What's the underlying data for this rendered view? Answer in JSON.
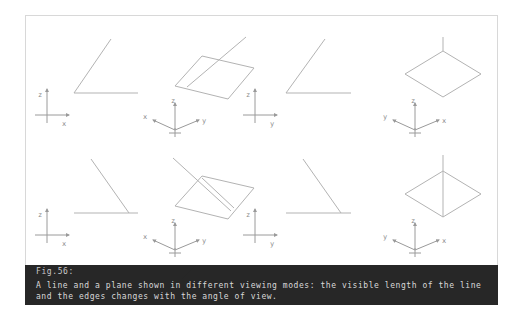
{
  "figure": {
    "label": "Fig.56:",
    "caption_line_1": "A line and a plane shown in different viewing modes: the visible length of the line",
    "caption_line_2": "and the edges changes with the angle of view.",
    "caption_full": "A line and a plane shown in different viewing modes: the visible length of the line and the edges changes with the angle of view."
  },
  "colors": {
    "background": "#ffffff",
    "frame_border": "#d8d8d8",
    "geometry_stroke": "#b3b3b3",
    "axis_stroke": "#9a9a9a",
    "axis_text": "#8a8a8a",
    "caption_band": "#272727",
    "caption_text": "#d9d9d9"
  },
  "panels": [
    {
      "id": "panel-1",
      "name": "front-view-line-up-right",
      "view_mode": "orthographic-front",
      "axes": [
        {
          "name": "z",
          "label": "z",
          "direction": "up"
        },
        {
          "name": "x",
          "label": "x",
          "direction": "right"
        }
      ],
      "geometry": [
        "horizontal-line",
        "diagonal-line-up-right"
      ]
    },
    {
      "id": "panel-2",
      "name": "isometric-plane-with-line-top",
      "view_mode": "isometric",
      "axes": [
        {
          "name": "x",
          "label": "x",
          "direction": "lower-left"
        },
        {
          "name": "z",
          "label": "z",
          "direction": "up"
        },
        {
          "name": "y",
          "label": "y",
          "direction": "lower-right"
        }
      ],
      "geometry": [
        "parallelogram-plane",
        "line-crossing-plane"
      ]
    },
    {
      "id": "panel-3",
      "name": "side-view-line-up-right",
      "view_mode": "orthographic-side",
      "axes": [
        {
          "name": "z",
          "label": "z",
          "direction": "up"
        },
        {
          "name": "y",
          "label": "y",
          "direction": "right"
        }
      ],
      "geometry": [
        "horizontal-line",
        "diagonal-line-up-right"
      ]
    },
    {
      "id": "panel-4",
      "name": "isometric-diamond-plane-short-line",
      "view_mode": "isometric-rotated",
      "axes": [
        {
          "name": "y",
          "label": "y",
          "direction": "lower-left"
        },
        {
          "name": "z",
          "label": "z",
          "direction": "up"
        },
        {
          "name": "x",
          "label": "x",
          "direction": "lower-right"
        }
      ],
      "geometry": [
        "diamond-plane",
        "short-vertical-line"
      ]
    },
    {
      "id": "panel-5",
      "name": "front-view-line-down-right",
      "view_mode": "orthographic-front",
      "axes": [
        {
          "name": "z",
          "label": "z",
          "direction": "up"
        },
        {
          "name": "x",
          "label": "x",
          "direction": "right"
        }
      ],
      "geometry": [
        "horizontal-line",
        "diagonal-line-down-right"
      ]
    },
    {
      "id": "panel-6",
      "name": "isometric-plane-with-line-through",
      "view_mode": "isometric",
      "axes": [
        {
          "name": "x",
          "label": "x",
          "direction": "lower-left"
        },
        {
          "name": "z",
          "label": "z",
          "direction": "up"
        },
        {
          "name": "y",
          "label": "y",
          "direction": "lower-right"
        }
      ],
      "geometry": [
        "parallelogram-plane",
        "line-through-plane"
      ]
    },
    {
      "id": "panel-7",
      "name": "side-view-line-down-right",
      "view_mode": "orthographic-side",
      "axes": [
        {
          "name": "z",
          "label": "z",
          "direction": "up"
        },
        {
          "name": "y",
          "label": "y",
          "direction": "right"
        }
      ],
      "geometry": [
        "horizontal-line",
        "diagonal-line-down-right"
      ]
    },
    {
      "id": "panel-8",
      "name": "isometric-diamond-plane-long-line",
      "view_mode": "isometric-rotated",
      "axes": [
        {
          "name": "y",
          "label": "y",
          "direction": "lower-left"
        },
        {
          "name": "z",
          "label": "z",
          "direction": "up"
        },
        {
          "name": "x",
          "label": "x",
          "direction": "lower-right"
        }
      ],
      "geometry": [
        "diamond-plane",
        "long-vertical-line"
      ]
    }
  ],
  "axis_labels": {
    "x": "x",
    "y": "y",
    "z": "z"
  }
}
